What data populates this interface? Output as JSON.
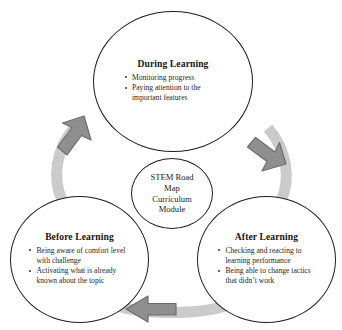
{
  "diagram": {
    "type": "cycle",
    "direction": "counter-clockwise",
    "center": {
      "lines": [
        "STEM Road",
        "Map",
        "Curriculum",
        "Module"
      ],
      "full_text": "STEM Road Map Curriculum Module"
    },
    "nodes": [
      {
        "id": "during-learning",
        "title": "During Learning",
        "bullets": [
          "Monitoring progress",
          "Paying attention to the important features"
        ]
      },
      {
        "id": "after-learning",
        "title": "After Learning",
        "bullets": [
          "Checking and reacting to learning performance",
          "Being able to change tactics that didn’t work"
        ]
      },
      {
        "id": "before-learning",
        "title": "Before Learning",
        "bullets": [
          "Being aware of comfort level with challenge",
          "Activating what is already known about the topic"
        ]
      }
    ],
    "arrows": [
      {
        "id": "arrow-during-to-after",
        "from": "during-learning",
        "to": "after-learning",
        "direction": "down-right"
      },
      {
        "id": "arrow-after-to-before",
        "from": "after-learning",
        "to": "before-learning",
        "direction": "left"
      },
      {
        "id": "arrow-before-to-during",
        "from": "before-learning",
        "to": "during-learning",
        "direction": "up-right"
      }
    ],
    "colors": {
      "outline": "#1c1c1c",
      "background": "#ffffff",
      "text": "#1d1d1d",
      "arrow_band": "#cbcbcb",
      "arrow_head": "#8f8f8f",
      "arrow_head_outline": "#6f6f6f"
    }
  }
}
